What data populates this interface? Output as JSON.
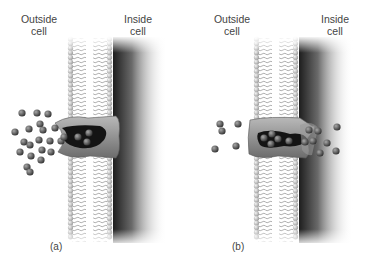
{
  "panels": [
    {
      "id": "a",
      "caption": "(a)",
      "outside_label": [
        "Outside",
        "cell"
      ],
      "inside_label": [
        "Inside",
        "cell"
      ],
      "state": "channel open to outside, many molecules outside"
    },
    {
      "id": "b",
      "caption": "(b)",
      "outside_label": [
        "Outside",
        "cell"
      ],
      "inside_label": [
        "Inside",
        "cell"
      ],
      "state": "channel open to inside, molecules released inside"
    }
  ],
  "colors": {
    "text": "#444444",
    "bead": "#cfcfcf",
    "protein": "#8a8a8a",
    "molecule": "#4a4a4a",
    "shadow": "#2a2a2a"
  }
}
